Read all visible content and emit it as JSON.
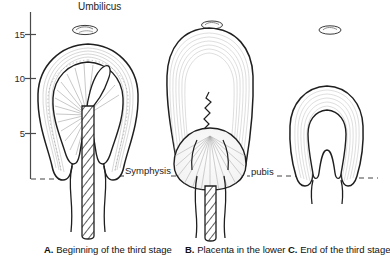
{
  "figure": {
    "title_label": "Umbilicus",
    "background": "#ffffff",
    "ink": "#1a1a1a",
    "axis": {
      "name": "centimeter-scale",
      "unit": "cm",
      "ticks": [
        15,
        10,
        5
      ],
      "tick_labels": [
        "15",
        "10",
        "5"
      ],
      "orientation": "vertical",
      "range_top": 17,
      "range_bottom": 0
    },
    "reference_line": {
      "left_label": "Symphysis",
      "right_label": "pubis",
      "style": "dashed"
    },
    "panels": [
      {
        "id": "A",
        "letter": "A.",
        "caption": "Beginning of the third stage",
        "full_caption": "A. Beginning of the third stage",
        "fundus_height_cm": 13,
        "umbilicus": "above-fundus",
        "placenta_position": "attached-to-fundus",
        "cord": "hatched-descending"
      },
      {
        "id": "B",
        "letter": "B.",
        "caption": "Placenta in the lower",
        "full_caption": "B. Placenta in the lower",
        "fundus_height_cm": 16,
        "umbilicus": "at-fundus",
        "placenta_position": "lower-uterine-segment",
        "cord": "hatched-descending"
      },
      {
        "id": "C",
        "letter": "C.",
        "caption": "End of the third stage",
        "full_caption": "C. End of the third stage",
        "fundus_height_cm": 9,
        "umbilicus": "above-fundus",
        "placenta_position": "expelled",
        "cord": "none"
      }
    ]
  }
}
